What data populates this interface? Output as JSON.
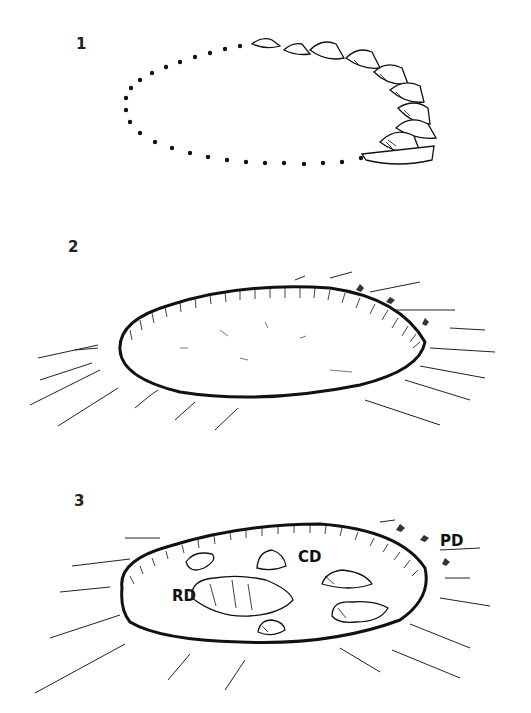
{
  "panels": [
    {
      "number": "1",
      "description": "Dotted ellipse outline with stones being placed around the perimeter"
    },
    {
      "number": "2",
      "description": "Raised oval platform with hatched rim and radiating lines"
    },
    {
      "number": "3",
      "description": "Oval platform with stone features inside and outside",
      "labels": {
        "rd": "RD",
        "cd": "CD",
        "pd": "PD"
      }
    }
  ]
}
